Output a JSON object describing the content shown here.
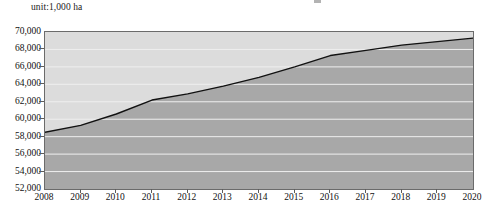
{
  "unit_label": "unit:1,000 ha",
  "colors": {
    "line": "#111111",
    "area_below": "#a8a8a8",
    "area_above": "#dcdcdc",
    "gridline": "#efefef",
    "frame": "#6b6b6b",
    "text": "#111111",
    "background": "#ffffff"
  },
  "axes": {
    "y_ticks": [
      "52,000",
      "54,000",
      "56,000",
      "58,000",
      "60,000",
      "62,000",
      "64,000",
      "66,000",
      "68,000",
      "70,000"
    ],
    "x_ticks": [
      "2008",
      "2009",
      "2010",
      "2011",
      "2012",
      "2013",
      "2014",
      "2015",
      "2016",
      "2017",
      "2018",
      "2019",
      "2020"
    ]
  },
  "chart_data": {
    "type": "area",
    "title": "",
    "subtitle": "",
    "xlabel": "",
    "ylabel": "",
    "unit": "unit:1,000 ha",
    "grid": true,
    "legend": "none",
    "ylim": [
      52000,
      70000
    ],
    "ytick_interval": 2000,
    "xlim": [
      2008,
      2020
    ],
    "categories": [
      2008,
      2009,
      2010,
      2011,
      2012,
      2013,
      2014,
      2015,
      2016,
      2017,
      2018,
      2019,
      2020
    ],
    "x": [
      2008,
      2009,
      2010,
      2011,
      2012,
      2013,
      2014,
      2015,
      2016,
      2017,
      2018,
      2019,
      2020
    ],
    "values": [
      58500,
      59300,
      60600,
      62200,
      62900,
      63800,
      64800,
      66000,
      67300,
      67900,
      68500,
      68900,
      69300
    ],
    "series": [
      {
        "name": "",
        "values": [
          58500,
          59300,
          60600,
          62200,
          62900,
          63800,
          64800,
          66000,
          67300,
          67900,
          68500,
          68900,
          69300
        ]
      }
    ]
  }
}
